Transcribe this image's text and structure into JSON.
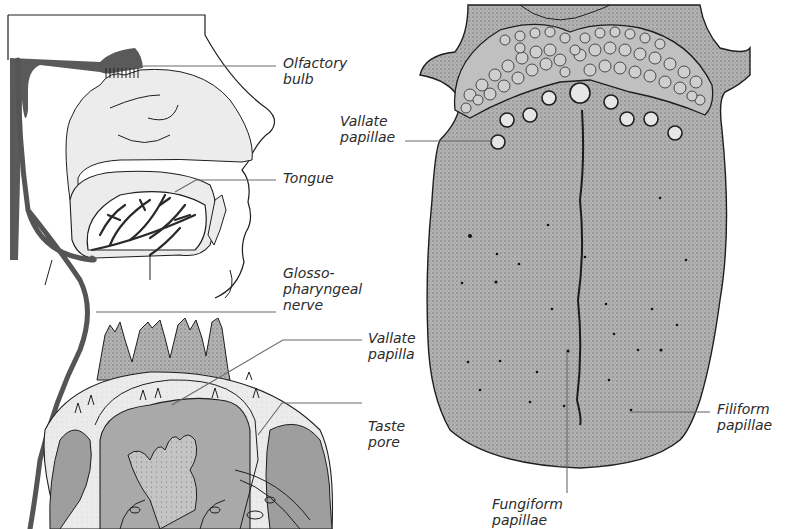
{
  "figure": {
    "type": "anatomical-illustration",
    "colors": {
      "background": "#ffffff",
      "tissue_light": "#ececec",
      "tissue_mid": "#b7b7b7",
      "tissue_dark": "#8f8f8f",
      "nerve": "#555555",
      "outline": "#1e1e1e",
      "leader_line": "#6a6a6a",
      "label_text": "#2b2b2b"
    }
  },
  "labels": {
    "olfactory_bulb": [
      "Olfactory",
      "bulb"
    ],
    "tongue": [
      "Tongue"
    ],
    "glossopharyngeal_nerve": [
      "Glosso-",
      "pharyngeal",
      "nerve"
    ],
    "vallate_papilla": [
      "Vallate",
      "papilla"
    ],
    "taste_pore": [
      "Taste",
      "pore"
    ],
    "vallate_papillae": [
      "Vallate",
      "papillae"
    ],
    "filiform_papillae": [
      "Filiform",
      "papillae"
    ],
    "fungiform_papillae": [
      "Fungiform",
      "papillae"
    ]
  }
}
